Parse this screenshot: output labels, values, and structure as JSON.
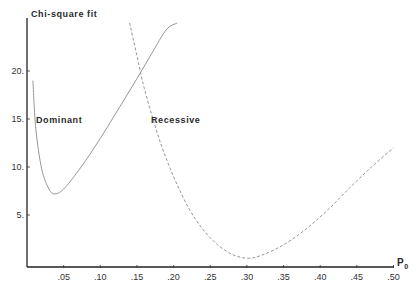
{
  "chart_data": {
    "type": "line",
    "title": "",
    "ylabel": "Chi-square fit",
    "xlabel": "P0",
    "xlabel_main": "P",
    "xlabel_sub": "0",
    "xlim": [
      0,
      0.5
    ],
    "ylim": [
      0,
      25
    ],
    "grid": false,
    "x_ticks": [
      ".05",
      ".10",
      ".15",
      ".20",
      ".25",
      ".30",
      ".35",
      ".40",
      ".45",
      ".50"
    ],
    "y_ticks": [
      "5.",
      "10.",
      "15.",
      "20."
    ],
    "series": [
      {
        "name": "Dominant",
        "style": "solid",
        "x": [
          0.008,
          0.012,
          0.02,
          0.03,
          0.038,
          0.05,
          0.07,
          0.09,
          0.11,
          0.13,
          0.15,
          0.17,
          0.19,
          0.205
        ],
        "y": [
          19.0,
          14.0,
          9.8,
          7.7,
          7.2,
          7.7,
          9.6,
          11.8,
          14.2,
          16.7,
          19.2,
          21.8,
          24.3,
          25.0
        ]
      },
      {
        "name": "Recessive",
        "style": "dashed",
        "x": [
          0.14,
          0.15,
          0.16,
          0.18,
          0.2,
          0.22,
          0.24,
          0.26,
          0.28,
          0.3,
          0.32,
          0.35,
          0.38,
          0.41,
          0.44,
          0.47,
          0.5
        ],
        "y": [
          25.0,
          21.6,
          18.2,
          13.0,
          9.0,
          5.8,
          3.5,
          1.9,
          0.9,
          0.5,
          0.8,
          1.9,
          3.5,
          5.5,
          7.8,
          10.0,
          12.0
        ]
      }
    ],
    "annotations": [
      {
        "text": "Dominant",
        "x": 0.015,
        "y": 15
      },
      {
        "text": "Recessive",
        "x": 0.165,
        "y": 15
      }
    ]
  }
}
